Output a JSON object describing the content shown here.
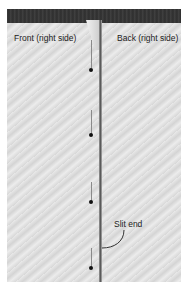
{
  "figure": {
    "labels": {
      "front": "Front (right side)",
      "back": "Back (right side)",
      "slit_end": "Slit end"
    },
    "pins": [
      {
        "x": 90,
        "y": 70
      },
      {
        "x": 90,
        "y": 135
      },
      {
        "x": 90,
        "y": 202
      },
      {
        "x": 90,
        "y": 268
      }
    ],
    "colors": {
      "band": "#333333",
      "fabric": "#dedede",
      "pin": "#111111",
      "text": "#222222"
    }
  }
}
